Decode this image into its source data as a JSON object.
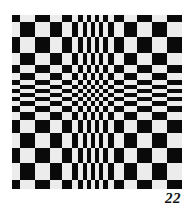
{
  "figure": {
    "type": "optical-illusion-checkerboard",
    "colors": {
      "dark": "#0a0a0a",
      "light": "#ececec",
      "background": "#ffffff"
    },
    "grid": {
      "col_edges": [
        12,
        20,
        35,
        50,
        62,
        72,
        78,
        83,
        87,
        91,
        95,
        99,
        103,
        108,
        114,
        124,
        137,
        152,
        167,
        182
      ],
      "row_edges": [
        15,
        22,
        37,
        53,
        65,
        73,
        80,
        85,
        89,
        93,
        97,
        101,
        106,
        112,
        120,
        133,
        148,
        163,
        180,
        189
      ],
      "top_left_dark": true
    }
  },
  "page_number": "22"
}
